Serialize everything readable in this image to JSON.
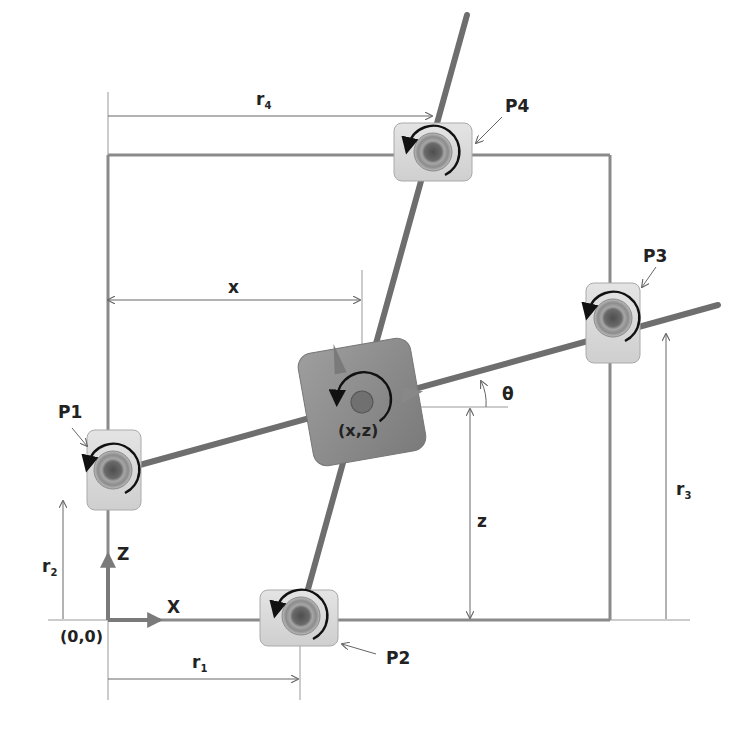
{
  "diagram": {
    "type": "planar-mechanism-schematic",
    "frame": {
      "label": "workspace boundary"
    },
    "origin": {
      "label": "(0,0)"
    },
    "axes": {
      "x_label": "X",
      "z_label": "Z"
    },
    "center_block": {
      "label": "(x,z)"
    },
    "angle": {
      "label": "θ"
    },
    "dimensions": {
      "x": {
        "label": "x"
      },
      "z": {
        "label": "z"
      },
      "r1": {
        "base": "r",
        "sub": "1"
      },
      "r2": {
        "base": "r",
        "sub": "2"
      },
      "r3": {
        "base": "r",
        "sub": "3"
      },
      "r4": {
        "base": "r",
        "sub": "4"
      }
    },
    "actuators": [
      {
        "id": "P1",
        "label": "P1",
        "edge": "left"
      },
      {
        "id": "P2",
        "label": "P2",
        "edge": "bottom"
      },
      {
        "id": "P3",
        "label": "P3",
        "edge": "right"
      },
      {
        "id": "P4",
        "label": "P4",
        "edge": "top"
      }
    ],
    "colors": {
      "frame": "#8a8a8a",
      "bar": "#6e6e6e",
      "block": "#8c8c8c",
      "actuator_body": "#d6d6d6",
      "hub_outer": "#9a9a9a",
      "hub_inner": "#5a5a5a",
      "text": "#222222"
    }
  }
}
